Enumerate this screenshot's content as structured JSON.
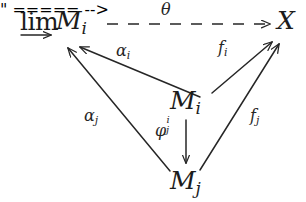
{
  "diagram": {
    "kind": "commutative-diagram",
    "stroke_color": "#262626",
    "text_color": "#1c1c1c",
    "background_color": "#ffffff",
    "nodes": [
      {
        "id": "colimit",
        "operator": "lim",
        "operator_decoration": "long-rightwards-arrow-below",
        "object_base": "M",
        "object_subscript": "i",
        "position": "top-left"
      },
      {
        "id": "codomain",
        "label": "X",
        "position": "top-right"
      },
      {
        "id": "center",
        "base": "M",
        "subscript": "i",
        "position": "center"
      },
      {
        "id": "bottom",
        "base": "M",
        "subscript": "j",
        "position": "bottom"
      }
    ],
    "arrows": [
      {
        "id": "theta",
        "label_base": "θ",
        "from": "colimit",
        "to": "codomain",
        "style": "dashed",
        "direction": "right"
      },
      {
        "id": "alpha-i",
        "label_base": "α",
        "label_subscript": "i",
        "from": "center",
        "to": "colimit",
        "style": "solid"
      },
      {
        "id": "alpha-j",
        "label_base": "α",
        "label_subscript": "j",
        "from": "bottom",
        "to": "colimit",
        "style": "solid"
      },
      {
        "id": "f-i",
        "label_base": "f",
        "label_subscript": "i",
        "from": "center",
        "to": "codomain",
        "style": "solid"
      },
      {
        "id": "f-j",
        "label_base": "f",
        "label_subscript": "j",
        "from": "bottom",
        "to": "codomain",
        "style": "solid"
      },
      {
        "id": "phi-i-j",
        "label_base": "φ",
        "label_superscript": "i",
        "label_subscript": "j",
        "from": "center",
        "to": "bottom",
        "style": "solid",
        "direction": "down"
      }
    ]
  },
  "nodes": {
    "colimit": {
      "operator": "lim",
      "base": "M",
      "subscript": "i"
    },
    "codomain": {
      "label": "X"
    },
    "center": {
      "base": "M",
      "subscript": "i"
    },
    "bottom": {
      "base": "M",
      "subscript": "j"
    }
  },
  "labels": {
    "theta": "θ",
    "alpha": "α",
    "phi": "φ",
    "f": "f",
    "sub_i": "i",
    "sub_j": "j",
    "sup_i": "i"
  }
}
